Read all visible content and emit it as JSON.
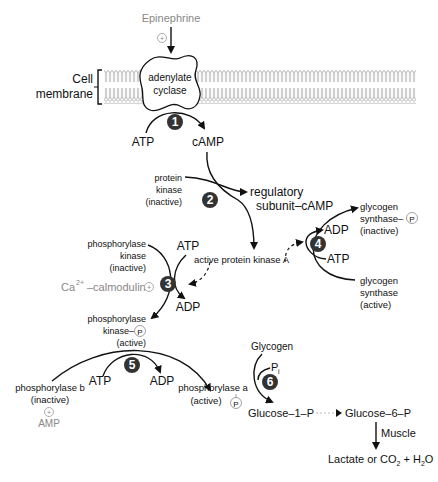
{
  "diagram": {
    "type": "Epinephrine-stimulated glycogen phosphorylase cascade",
    "membrane": {
      "label_line1": "Cell",
      "label_line2": "membrane"
    },
    "epinephrine": {
      "label": "Epinephrine",
      "modifier": "+"
    },
    "adenylate_cyclase": {
      "line1": "adenylate",
      "line2": "cyclase"
    },
    "steps": [
      "1",
      "2",
      "3",
      "4",
      "5",
      "6"
    ],
    "step1": {
      "substrate": "ATP",
      "product": "cAMP"
    },
    "step2": {
      "pk_inactive": [
        "protein",
        "kinase",
        "(inactive)"
      ],
      "regulatory": [
        "regulatory",
        "subunit–cAMP"
      ],
      "active_pk": "active protein kinase A"
    },
    "step3": {
      "pk_inactive": [
        "phosphorylase",
        "kinase",
        "(inactive)"
      ],
      "atp": "ATP",
      "adp": "ADP",
      "calmodulin_base": "Ca",
      "calmodulin_sup": "2+",
      "calmodulin_rest": "–calmodulin",
      "calmodulin_modifier": "+",
      "pk_active": [
        "phosphorylase",
        "kinase–",
        "(active)"
      ],
      "p_label": "P"
    },
    "step4": {
      "gs_inactive": [
        "glycogen",
        "synthase–",
        "(inactive)"
      ],
      "p_label": "P",
      "adp": "ADP",
      "atp": "ATP",
      "gs_active": [
        "glycogen",
        "synthase",
        "(active)"
      ]
    },
    "step5": {
      "phos_b": [
        "phosphorylase b",
        "(inactive)"
      ],
      "atp": "ATP",
      "adp": "ADP",
      "phos_a": [
        "phosphorylase a",
        "(active)"
      ],
      "p_label": "P",
      "amp_modifier": "+",
      "amp": "AMP"
    },
    "step6": {
      "glycogen": "Glycogen",
      "pi_base": "P",
      "pi_sub": "i",
      "g1p": "Glucose–1–P",
      "g6p": "Glucose–6–P",
      "muscle": "Muscle",
      "end_prefix": "Lactate or CO",
      "end_sub1": "2",
      "end_mid": " + H",
      "end_sub2": "2",
      "end_suffix": "O"
    }
  }
}
